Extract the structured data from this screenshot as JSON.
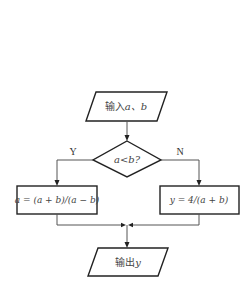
{
  "flowchart": {
    "input_node": {
      "prefix": "输入",
      "vars": "a、b"
    },
    "decision_node": {
      "text": "a<b?"
    },
    "branch_yes": {
      "label": "Y"
    },
    "branch_no": {
      "label": "N"
    },
    "process_yes": {
      "text": "a = (a + b)/(a − b)"
    },
    "process_no": {
      "text": "y = 4/(a + b)"
    },
    "output_node": {
      "prefix": "输出",
      "vars": "y"
    }
  },
  "colors": {
    "stroke": "#222222",
    "connector": "#555555",
    "text": "#444444",
    "background": "#ffffff"
  }
}
